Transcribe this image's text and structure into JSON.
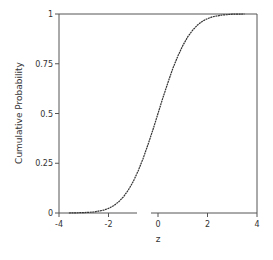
{
  "chart_data": {
    "type": "line",
    "title": "",
    "xlabel": "z",
    "ylabel": "Cumulative Probability",
    "xlim": [
      -4,
      4
    ],
    "ylim": [
      0,
      1
    ],
    "x_ticks": [
      -4,
      -2,
      0,
      2,
      4
    ],
    "x_tick_labels": [
      "-4",
      "-2",
      "0",
      "2",
      "4"
    ],
    "y_ticks": [
      0,
      0.25,
      0.5,
      0.75,
      1
    ],
    "y_tick_labels": [
      "0",
      "0.25",
      "0.5",
      "0.75",
      "1"
    ],
    "grid": false,
    "legend": null,
    "series": [
      {
        "name": "Empirical CDF",
        "style": "dotted-dark",
        "x": [
          -3.6,
          -3.0,
          -2.6,
          -2.2,
          -2.0,
          -1.8,
          -1.6,
          -1.4,
          -1.2,
          -1.0,
          -0.8,
          -0.6,
          -0.4,
          -0.2,
          0.0,
          0.2,
          0.4,
          0.6,
          0.8,
          1.0,
          1.2,
          1.4,
          1.6,
          1.8,
          2.0,
          2.2,
          2.6,
          3.0,
          3.5
        ],
        "values": [
          0.0,
          0.002,
          0.005,
          0.014,
          0.023,
          0.036,
          0.055,
          0.081,
          0.115,
          0.159,
          0.212,
          0.274,
          0.345,
          0.421,
          0.5,
          0.579,
          0.655,
          0.726,
          0.788,
          0.841,
          0.885,
          0.919,
          0.945,
          0.964,
          0.977,
          0.986,
          0.995,
          0.999,
          1.0
        ]
      }
    ]
  }
}
